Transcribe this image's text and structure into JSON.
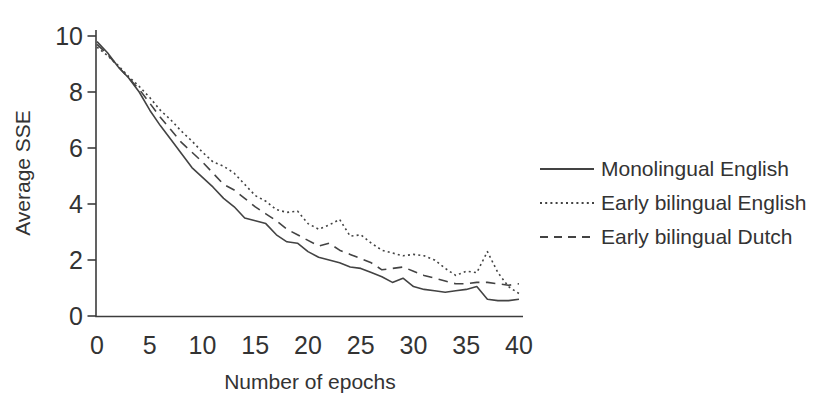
{
  "figure": {
    "background": "#ffffff",
    "ink_color": "#434343",
    "text_color": "#333333"
  },
  "chart_data": {
    "type": "line",
    "title": "",
    "xlabel": "Number of epochs",
    "ylabel": "Average SSE",
    "xlim": [
      0,
      40
    ],
    "ylim": [
      0,
      10
    ],
    "x_ticks": [
      0,
      5,
      10,
      15,
      20,
      25,
      30,
      35,
      40
    ],
    "y_ticks": [
      0,
      2,
      4,
      6,
      8,
      10
    ],
    "grid": false,
    "legend_position": "right-outside",
    "x": [
      0,
      1,
      2,
      3,
      4,
      5,
      6,
      7,
      8,
      9,
      10,
      11,
      12,
      13,
      14,
      15,
      16,
      17,
      18,
      19,
      20,
      21,
      22,
      23,
      24,
      25,
      26,
      27,
      28,
      29,
      30,
      31,
      32,
      33,
      34,
      35,
      36,
      37,
      38,
      39,
      40
    ],
    "series": [
      {
        "name": "Monolingual English",
        "style": "solid",
        "values": [
          9.8,
          9.4,
          8.9,
          8.5,
          8.0,
          7.35,
          6.8,
          6.3,
          5.8,
          5.3,
          4.95,
          4.6,
          4.2,
          3.9,
          3.5,
          3.4,
          3.3,
          2.9,
          2.65,
          2.6,
          2.3,
          2.1,
          2.0,
          1.9,
          1.75,
          1.7,
          1.55,
          1.4,
          1.2,
          1.35,
          1.05,
          0.95,
          0.9,
          0.85,
          0.9,
          0.95,
          1.05,
          0.6,
          0.55,
          0.55,
          0.6
        ]
      },
      {
        "name": "Early bilingual English",
        "style": "dotted",
        "values": [
          9.6,
          9.3,
          8.95,
          8.55,
          8.2,
          7.8,
          7.35,
          7.0,
          6.6,
          6.25,
          5.85,
          5.5,
          5.35,
          5.1,
          4.7,
          4.3,
          4.1,
          3.8,
          3.7,
          3.75,
          3.3,
          3.1,
          3.25,
          3.45,
          2.85,
          2.9,
          2.6,
          2.35,
          2.25,
          2.15,
          2.2,
          2.15,
          2.0,
          1.7,
          1.45,
          1.6,
          1.55,
          2.3,
          1.55,
          1.05,
          0.8
        ]
      },
      {
        "name": "Early bilingual Dutch",
        "style": "dashed",
        "values": [
          9.7,
          9.35,
          8.9,
          8.5,
          8.1,
          7.6,
          7.1,
          6.65,
          6.2,
          5.85,
          5.5,
          5.1,
          4.7,
          4.5,
          4.2,
          3.9,
          3.65,
          3.4,
          3.1,
          2.9,
          2.7,
          2.5,
          2.6,
          2.35,
          2.2,
          2.05,
          1.9,
          1.65,
          1.7,
          1.75,
          1.6,
          1.45,
          1.35,
          1.25,
          1.15,
          1.15,
          1.2,
          1.2,
          1.15,
          1.1,
          1.15
        ]
      }
    ]
  }
}
